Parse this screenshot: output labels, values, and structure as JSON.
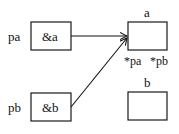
{
  "diagram": {
    "pointers": [
      {
        "name": "pa",
        "value": "&a",
        "target": "a"
      },
      {
        "name": "pb",
        "value": "&b",
        "target": "a"
      }
    ],
    "variables": [
      {
        "name": "a",
        "annotations": [
          "*pa",
          "*pb"
        ]
      },
      {
        "name": "b",
        "annotations": []
      }
    ],
    "colors": {
      "line": "#111111",
      "background": "#ffffff"
    }
  }
}
